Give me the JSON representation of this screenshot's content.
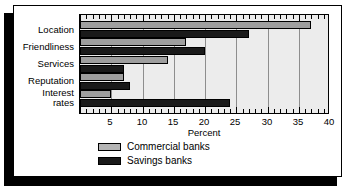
{
  "chart_data": {
    "type": "bar",
    "orientation": "horizontal",
    "title": "",
    "xlabel": "Percent",
    "ylabel": "",
    "xlim": [
      0,
      40
    ],
    "xticks": [
      0,
      5,
      10,
      15,
      20,
      25,
      30,
      35,
      40
    ],
    "xticklabels": [
      "",
      "5",
      "10",
      "15",
      "20",
      "25",
      "30",
      "35",
      "40"
    ],
    "minor_tick_step": 1,
    "grid": true,
    "grid_axis": "x",
    "legend_position": "below-plot-left",
    "categories": [
      "Location",
      "Friendliness",
      "Services",
      "Reputation",
      "Interest\nrates"
    ],
    "series": [
      {
        "name": "Commercial banks",
        "color": "#9e9e9e",
        "values": [
          37,
          17,
          14,
          7,
          5
        ]
      },
      {
        "name": "Savings banks",
        "color": "#1a1a1a",
        "values": [
          27,
          20,
          7,
          8,
          24
        ]
      }
    ]
  },
  "legend": {
    "items": [
      {
        "label": "Commercial banks",
        "swatch": "commercial"
      },
      {
        "label": "Savings banks",
        "swatch": "savings"
      }
    ]
  },
  "axis": {
    "x_title": "Percent",
    "tick_labels": [
      "",
      "5",
      "10",
      "15",
      "20",
      "25",
      "30",
      "35",
      "40"
    ]
  },
  "colors": {
    "plot_background": "#ececec",
    "commercial": "#9e9e9e",
    "savings": "#1a1a1a",
    "gridline": "#8d8d8d",
    "frame": "#000000",
    "shadow": "#000000",
    "card_background": "#ffffff"
  }
}
